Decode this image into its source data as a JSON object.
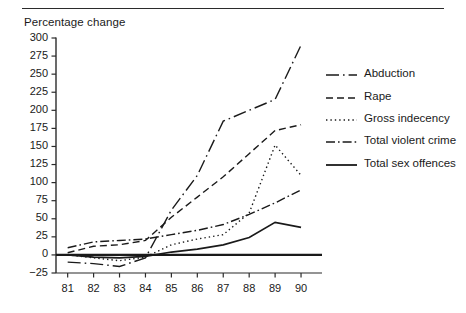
{
  "figure": {
    "axis_title": "Percentage change",
    "has_top_rule": true
  },
  "chart_data": {
    "type": "line",
    "title": "",
    "subtitle": "",
    "xlabel": "",
    "ylabel": "Percentage change",
    "x": [
      81,
      82,
      83,
      84,
      85,
      86,
      87,
      88,
      89,
      90
    ],
    "xtick_labels": [
      "81",
      "82",
      "83",
      "84",
      "85",
      "86",
      "87",
      "88",
      "89",
      "90"
    ],
    "ytick_labels": [
      "-25",
      "0",
      "25",
      "50",
      "75",
      "100",
      "125",
      "150",
      "175",
      "200",
      "225",
      "250",
      "275",
      "300"
    ],
    "ytick_values": [
      -25,
      0,
      25,
      50,
      75,
      100,
      125,
      150,
      175,
      200,
      225,
      250,
      275,
      300
    ],
    "xlim": [
      80.55,
      90.5
    ],
    "ylim": [
      -25,
      300
    ],
    "grid": false,
    "legend_position": "right",
    "zero_line": true,
    "series": [
      {
        "name": "Abduction",
        "dash": "long-dash",
        "values": [
          -10,
          -12,
          -16,
          -4,
          62,
          110,
          185,
          200,
          215,
          290
        ]
      },
      {
        "name": "Rape",
        "dash": "dashed",
        "values": [
          3,
          12,
          14,
          20,
          52,
          80,
          108,
          140,
          172,
          180
        ]
      },
      {
        "name": "Gross indecency",
        "dash": "dotted",
        "values": [
          0,
          -4,
          -8,
          -3,
          14,
          22,
          28,
          58,
          152,
          110
        ]
      },
      {
        "name": "Total violent crime",
        "dash": "dash-dot",
        "values": [
          10,
          18,
          20,
          22,
          28,
          34,
          42,
          56,
          72,
          90
        ]
      },
      {
        "name": "Total sex offences",
        "dash": "solid",
        "values": [
          0,
          -3,
          -4,
          -2,
          4,
          8,
          14,
          24,
          45,
          38
        ]
      }
    ]
  },
  "legend": {
    "items": [
      {
        "label": "Abduction",
        "key": "long-dash"
      },
      {
        "label": "Rape",
        "key": "dashed"
      },
      {
        "label": "Gross indecency",
        "key": "dotted"
      },
      {
        "label": "Total violent crime",
        "key": "dash-dot"
      },
      {
        "label": "Total sex offences",
        "key": "solid"
      }
    ]
  }
}
